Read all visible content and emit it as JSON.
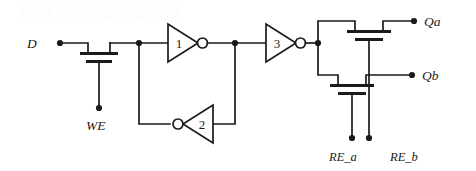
{
  "figure": {
    "kind": "circuit-schematic",
    "background_color": "#ffffff",
    "line_color": "#1a1a1a"
  },
  "watermark": {
    "text": "░░░░ ░░░░░░░░░░░░░░"
  },
  "signals": {
    "data_in": "D",
    "write_enable": "WE",
    "read_enable_a": "RE_a",
    "read_enable_b": "RE_b",
    "out_a": "Qa",
    "out_b": "Qb"
  },
  "inverters": [
    {
      "id": "inv1",
      "label": "1",
      "direction": "right"
    },
    {
      "id": "inv2",
      "label": "2",
      "direction": "left"
    },
    {
      "id": "inv3",
      "label": "3",
      "direction": "right"
    }
  ],
  "transistors": [
    {
      "id": "write-pass-transistor",
      "gate_signal": "WE"
    },
    {
      "id": "read-transistor-a",
      "gate_signal": "RE_a",
      "output": "Qa"
    },
    {
      "id": "read-transistor-b",
      "gate_signal": "RE_b",
      "output": "Qb"
    }
  ]
}
